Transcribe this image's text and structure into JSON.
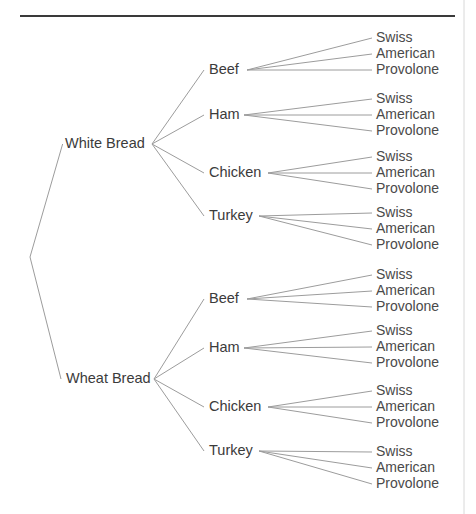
{
  "diagram": {
    "type": "tree",
    "orientation": "left-to-right",
    "levels": [
      "Bread",
      "Meat",
      "Cheese"
    ],
    "line_color": "#9c9c9c",
    "text_color": "#3b3b3b",
    "rule_color": "#3a3a3a",
    "border_color": "#d8d8d8",
    "background_color": "#ffffff",
    "root": {
      "x": 30,
      "y": 257
    },
    "top_rule": {
      "x1": 20,
      "y1": 16,
      "x2": 455,
      "y2": 16
    },
    "right_border": {
      "x": 464,
      "y1": 0,
      "y2": 514
    },
    "breads": [
      {
        "label": "White Bread",
        "text_x": 65,
        "y": 144,
        "fan_x": 152,
        "meats": [
          {
            "label": "Beef",
            "text_x": 209,
            "y": 70,
            "fan_x": 247,
            "cheeses": [
              {
                "label": "Swiss",
                "y": 38
              },
              {
                "label": "American",
                "y": 54
              },
              {
                "label": "Provolone",
                "y": 70
              }
            ]
          },
          {
            "label": "Ham",
            "text_x": 209,
            "y": 115,
            "fan_x": 244,
            "cheeses": [
              {
                "label": "Swiss",
                "y": 99
              },
              {
                "label": "American",
                "y": 115
              },
              {
                "label": "Provolone",
                "y": 131
              }
            ]
          },
          {
            "label": "Chicken",
            "text_x": 209,
            "y": 173,
            "fan_x": 268,
            "cheeses": [
              {
                "label": "Swiss",
                "y": 157
              },
              {
                "label": "American",
                "y": 173
              },
              {
                "label": "Provolone",
                "y": 189
              }
            ]
          },
          {
            "label": "Turkey",
            "text_x": 209,
            "y": 216,
            "fan_x": 259,
            "cheeses": [
              {
                "label": "Swiss",
                "y": 213
              },
              {
                "label": "American",
                "y": 229
              },
              {
                "label": "Provolone",
                "y": 245
              }
            ]
          }
        ]
      },
      {
        "label": "Wheat Bread",
        "text_x": 66,
        "y": 379,
        "fan_x": 154,
        "meats": [
          {
            "label": "Beef",
            "text_x": 209,
            "y": 299,
            "fan_x": 247,
            "cheeses": [
              {
                "label": "Swiss",
                "y": 275
              },
              {
                "label": "American",
                "y": 291
              },
              {
                "label": "Provolone",
                "y": 307
              }
            ]
          },
          {
            "label": "Ham",
            "text_x": 209,
            "y": 348,
            "fan_x": 244,
            "cheeses": [
              {
                "label": "Swiss",
                "y": 331
              },
              {
                "label": "American",
                "y": 347
              },
              {
                "label": "Provolone",
                "y": 363
              }
            ]
          },
          {
            "label": "Chicken",
            "text_x": 209,
            "y": 407,
            "fan_x": 268,
            "cheeses": [
              {
                "label": "Swiss",
                "y": 391
              },
              {
                "label": "American",
                "y": 407
              },
              {
                "label": "Provolone",
                "y": 423
              }
            ]
          },
          {
            "label": "Turkey",
            "text_x": 209,
            "y": 451,
            "fan_x": 259,
            "cheeses": [
              {
                "label": "Swiss",
                "y": 452
              },
              {
                "label": "American",
                "y": 468
              },
              {
                "label": "Provolone",
                "y": 484
              }
            ]
          }
        ]
      }
    ],
    "leaf_text_x": 376,
    "leaf_edge_end_x": 372
  }
}
